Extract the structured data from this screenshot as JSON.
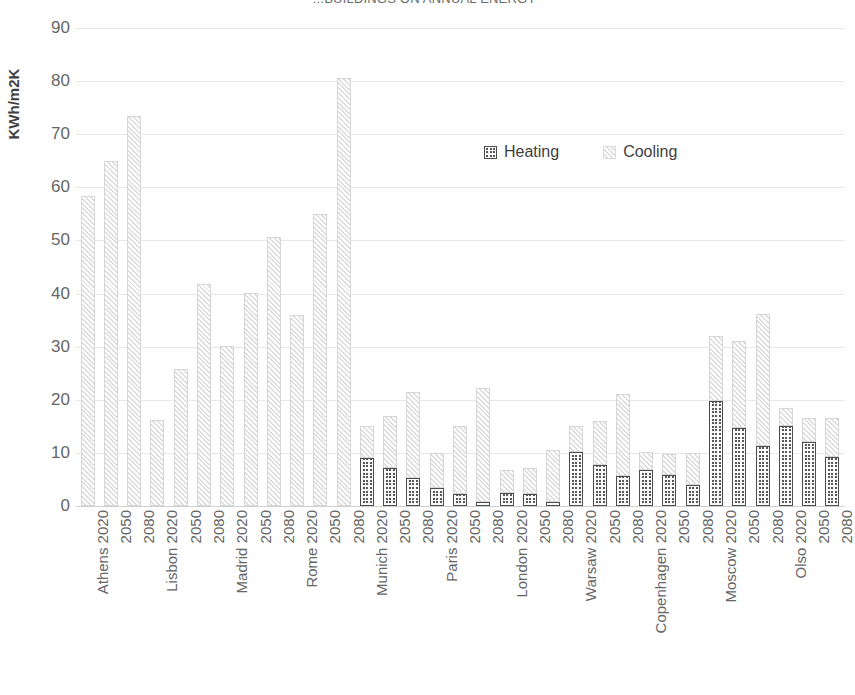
{
  "chart_data": {
    "type": "bar",
    "subtype": "stacked-bar",
    "title": "...BUILDINGS ON ANNUAL ENERGY",
    "xlabel": "",
    "ylabel": "KWh/m2K",
    "ylim": [
      0,
      90
    ],
    "yticks": [
      0,
      10,
      20,
      30,
      40,
      50,
      60,
      70,
      80,
      90
    ],
    "grid": true,
    "legend_position": "inside-top-center",
    "legend": [
      "Heating",
      "Cooling"
    ],
    "colors": {
      "heating": "#595959",
      "cooling": "#f2f2f2",
      "gridline": "#e8e8e8",
      "text": "#666666",
      "axis_title": "#3f3f3f"
    },
    "group_label_key": "city",
    "categories": [
      "Athens 2020",
      "2050",
      "2080",
      "Lisbon 2020",
      "2050",
      "2080",
      "Madrid 2020",
      "2050",
      "2080",
      "Rome 2020",
      "2050",
      "2080",
      "Munich 2020",
      "2050",
      "2080",
      "Paris 2020",
      "2050",
      "2080",
      "London 2020",
      "2050",
      "2080",
      "Warsaw 2020",
      "2050",
      "2080",
      "Copenhagen 2020",
      "2050",
      "2080",
      "Moscow 2020",
      "2050",
      "2080",
      "Olso 2020",
      "2050",
      "2080"
    ],
    "series": [
      {
        "name": "Heating",
        "values": [
          0,
          0,
          0,
          0,
          0,
          0,
          0,
          0,
          0,
          0,
          0,
          0,
          9.0,
          7.1,
          5.3,
          3.3,
          2.2,
          0.7,
          2.5,
          2.2,
          0.8,
          10.1,
          7.7,
          5.6,
          6.8,
          5.8,
          3.9,
          19.7,
          14.7,
          11.3,
          15.0,
          12.0,
          9.3
        ]
      },
      {
        "name": "Cooling",
        "values": [
          58.3,
          65.0,
          73.4,
          16.2,
          25.8,
          41.8,
          30.2,
          40.1,
          50.7,
          36.0,
          55.0,
          80.5,
          6.0,
          9.9,
          16.2,
          6.7,
          12.9,
          21.5,
          4.2,
          4.9,
          9.7,
          4.9,
          8.3,
          15.4,
          3.4,
          4.0,
          6.1,
          12.3,
          16.3,
          24.9,
          3.5,
          4.5,
          7.2
        ]
      }
    ],
    "totals": [
      58.3,
      65.0,
      73.4,
      16.2,
      25.8,
      41.8,
      30.2,
      40.1,
      50.7,
      36.0,
      55.0,
      80.5,
      15.0,
      17.0,
      21.5,
      10.0,
      15.1,
      22.2,
      6.7,
      7.1,
      10.5,
      15.0,
      16.0,
      21.0,
      10.2,
      9.8,
      10.0,
      32.0,
      31.0,
      36.2,
      18.5,
      16.5,
      16.5
    ],
    "cities": [
      "Athens",
      "Lisbon",
      "Madrid",
      "Rome",
      "Munich",
      "Paris",
      "London",
      "Warsaw",
      "Copenhagen",
      "Moscow",
      "Olso"
    ],
    "years": [
      "2020",
      "2050",
      "2080"
    ]
  }
}
